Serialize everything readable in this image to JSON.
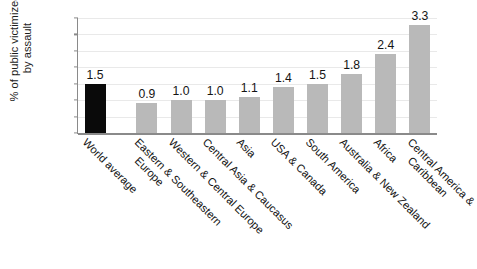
{
  "chart_data": {
    "type": "bar",
    "title": "",
    "xlabel": "",
    "ylabel": "% of public victimized by assault",
    "ylabel_lines": [
      "% of public victimized",
      "by assault"
    ],
    "ylim": [
      0.0,
      3.5
    ],
    "ytick_labels": [
      "0.0",
      "0.5",
      "1.0",
      "1.5",
      "2.0",
      "2.5",
      "3.0",
      "3.5"
    ],
    "ytick_values": [
      0.0,
      0.5,
      1.0,
      1.5,
      2.0,
      2.5,
      3.0,
      3.5
    ],
    "grid": true,
    "legend": "none",
    "categories": [
      "World average",
      "Eastern & Southeastern Europe",
      "Western & Central Europe",
      "Central Asia & Caucasus",
      "Asia",
      "USA & Canada",
      "South America",
      "Australia & New Zealand",
      "Africa",
      "Central America & Caribbean"
    ],
    "category_lines": [
      [
        "World average"
      ],
      [
        "Eastern & Southeastern",
        "Europe"
      ],
      [
        "Western & Central Europe"
      ],
      [
        "Central Asia & Caucasus"
      ],
      [
        "Asia"
      ],
      [
        "USA & Canada"
      ],
      [
        "South America"
      ],
      [
        "Australia & New Zealand"
      ],
      [
        "Africa"
      ],
      [
        "Central America &",
        "Caribbean"
      ]
    ],
    "values": [
      1.5,
      0.9,
      1.0,
      1.0,
      1.1,
      1.4,
      1.5,
      1.8,
      2.4,
      3.3
    ],
    "value_labels": [
      "1.5",
      "0.9",
      "1.0",
      "1.0",
      "1.1",
      "1.4",
      "1.5",
      "1.8",
      "2.4",
      "3.3"
    ],
    "bar_colors": [
      "#0a0a0a",
      "#b9b9b9",
      "#b9b9b9",
      "#b9b9b9",
      "#b9b9b9",
      "#b9b9b9",
      "#b9b9b9",
      "#b9b9b9",
      "#b9b9b9",
      "#b9b9b9"
    ],
    "highlight_index": 0,
    "colors": {
      "highlight": "#0a0a0a",
      "bar": "#b9b9b9",
      "axis": "#8a8a8a",
      "grid": "#e9e9e9",
      "text": "#141414",
      "background": "#ffffff"
    }
  }
}
